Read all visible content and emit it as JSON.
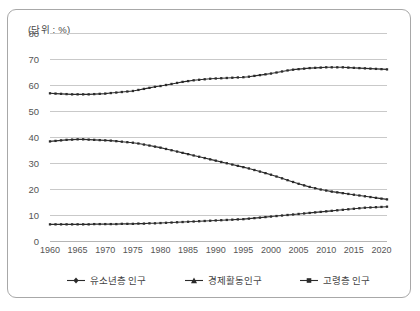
{
  "unit_label": "(단위 : %)",
  "axis": {
    "y_ticks": [
      "80",
      "70",
      "60",
      "50",
      "40",
      "30",
      "20",
      "10",
      "0"
    ],
    "x_ticks": [
      "1960",
      "1965",
      "1970",
      "1975",
      "1980",
      "1985",
      "1990",
      "1995",
      "2000",
      "2005",
      "2010",
      "2015",
      "2020"
    ]
  },
  "legend": {
    "items": [
      {
        "label": "유소년층 인구",
        "marker": "diamond-marker",
        "color": "#2b2b2b"
      },
      {
        "label": "경제활동인구",
        "marker": "triangle-marker",
        "color": "#2b2b2b"
      },
      {
        "label": "고령층 인구",
        "marker": "square-marker",
        "color": "#2b2b2b"
      }
    ]
  },
  "chart_data": {
    "type": "line",
    "title": "",
    "subtitle": "",
    "xlabel": "",
    "ylabel": "",
    "unit": "%",
    "grid": true,
    "legend_position": "bottom",
    "xlim": [
      1960,
      2021
    ],
    "ylim": [
      0,
      80
    ],
    "ytick_values": [
      0,
      10,
      20,
      30,
      40,
      50,
      60,
      70,
      80
    ],
    "xtick_values": [
      1960,
      1965,
      1970,
      1975,
      1980,
      1985,
      1990,
      1995,
      2000,
      2005,
      2010,
      2015,
      2020
    ],
    "x": [
      1960,
      1961,
      1962,
      1963,
      1964,
      1965,
      1966,
      1967,
      1968,
      1969,
      1970,
      1971,
      1972,
      1973,
      1974,
      1975,
      1976,
      1977,
      1978,
      1979,
      1980,
      1981,
      1982,
      1983,
      1984,
      1985,
      1986,
      1987,
      1988,
      1989,
      1990,
      1991,
      1992,
      1993,
      1994,
      1995,
      1996,
      1997,
      1998,
      1999,
      2000,
      2001,
      2002,
      2003,
      2004,
      2005,
      2006,
      2007,
      2008,
      2009,
      2010,
      2011,
      2012,
      2013,
      2014,
      2015,
      2016,
      2017,
      2018,
      2019,
      2020,
      2021
    ],
    "series": [
      {
        "name": "경제활동인구",
        "marker": "triangle-marker",
        "color": "#2b2b2b",
        "values": [
          56.8,
          56.7,
          56.6,
          56.5,
          56.4,
          56.4,
          56.4,
          56.4,
          56.5,
          56.6,
          56.7,
          56.9,
          57.1,
          57.3,
          57.5,
          57.7,
          58.1,
          58.5,
          58.9,
          59.3,
          59.6,
          60.0,
          60.4,
          60.8,
          61.2,
          61.5,
          61.8,
          62.0,
          62.2,
          62.4,
          62.5,
          62.6,
          62.7,
          62.8,
          62.9,
          63.0,
          63.2,
          63.5,
          63.8,
          64.1,
          64.4,
          64.8,
          65.2,
          65.6,
          65.9,
          66.1,
          66.3,
          66.5,
          66.6,
          66.7,
          66.8,
          66.8,
          66.8,
          66.8,
          66.7,
          66.6,
          66.5,
          66.4,
          66.3,
          66.2,
          66.1,
          66.0
        ]
      },
      {
        "name": "유소년층 인구",
        "marker": "diamond-marker",
        "color": "#2b2b2b",
        "values": [
          38.3,
          38.5,
          38.7,
          38.9,
          39.0,
          39.1,
          39.1,
          39.0,
          38.9,
          38.8,
          38.7,
          38.6,
          38.4,
          38.2,
          38.0,
          37.8,
          37.5,
          37.1,
          36.7,
          36.3,
          35.9,
          35.4,
          34.9,
          34.4,
          33.9,
          33.4,
          32.9,
          32.4,
          31.9,
          31.4,
          30.9,
          30.4,
          29.9,
          29.4,
          28.9,
          28.4,
          27.9,
          27.3,
          26.7,
          26.1,
          25.5,
          24.8,
          24.1,
          23.4,
          22.7,
          22.0,
          21.4,
          20.8,
          20.3,
          19.8,
          19.4,
          19.0,
          18.7,
          18.4,
          18.1,
          17.8,
          17.5,
          17.2,
          16.9,
          16.6,
          16.3,
          16.0
        ]
      },
      {
        "name": "고령층 인구",
        "marker": "square-marker",
        "color": "#2b2b2b",
        "values": [
          6.4,
          6.4,
          6.4,
          6.4,
          6.4,
          6.4,
          6.4,
          6.4,
          6.5,
          6.5,
          6.5,
          6.5,
          6.5,
          6.6,
          6.6,
          6.6,
          6.7,
          6.7,
          6.8,
          6.8,
          6.9,
          7.0,
          7.1,
          7.2,
          7.3,
          7.4,
          7.5,
          7.6,
          7.7,
          7.8,
          7.9,
          8.0,
          8.1,
          8.2,
          8.3,
          8.4,
          8.6,
          8.8,
          9.0,
          9.2,
          9.4,
          9.6,
          9.8,
          10.0,
          10.2,
          10.4,
          10.6,
          10.8,
          11.0,
          11.2,
          11.4,
          11.6,
          11.8,
          12.0,
          12.2,
          12.4,
          12.6,
          12.8,
          12.9,
          13.0,
          13.1,
          13.2
        ]
      }
    ]
  }
}
